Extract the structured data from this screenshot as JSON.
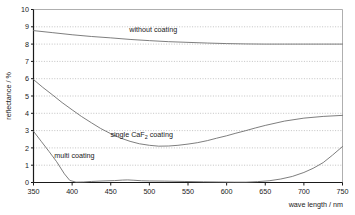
{
  "chart_data": {
    "type": "line",
    "title": "",
    "xlabel": "wave length / nm",
    "ylabel": "reflectance / %",
    "xlim": [
      350,
      750
    ],
    "ylim": [
      0,
      10
    ],
    "xticks": [
      350,
      400,
      450,
      500,
      550,
      600,
      650,
      700,
      750
    ],
    "yticks": [
      0,
      1,
      2,
      3,
      4,
      5,
      6,
      7,
      8,
      9,
      10
    ],
    "grid": "horizontal-dotted",
    "legend": "inline-annotations",
    "series": [
      {
        "name": "without coating",
        "label": "without coating",
        "label_x": 505,
        "label_y": 8.72,
        "x": [
          350,
          375,
          400,
          425,
          450,
          475,
          500,
          525,
          550,
          575,
          600,
          625,
          650,
          675,
          700,
          725,
          750
        ],
        "values": [
          8.78,
          8.66,
          8.54,
          8.44,
          8.36,
          8.27,
          8.2,
          8.14,
          8.1,
          8.06,
          8.03,
          8.01,
          8.0,
          8.0,
          8.0,
          8.0,
          8.0
        ]
      },
      {
        "name": "single CaF2 coating",
        "label_prefix": "single CaF",
        "label_sub": "2",
        "label_suffix": " coating",
        "label_x": 490,
        "label_y": 2.63,
        "x": [
          350,
          362,
          375,
          387,
          400,
          412,
          425,
          437,
          450,
          462,
          475,
          487,
          500,
          512,
          525,
          537,
          550,
          562,
          575,
          587,
          600,
          612,
          625,
          637,
          650,
          675,
          700,
          725,
          750
        ],
        "values": [
          5.95,
          5.5,
          5.05,
          4.62,
          4.2,
          3.82,
          3.45,
          3.12,
          2.82,
          2.58,
          2.38,
          2.24,
          2.15,
          2.1,
          2.11,
          2.15,
          2.22,
          2.3,
          2.42,
          2.56,
          2.7,
          2.85,
          3.0,
          3.15,
          3.3,
          3.55,
          3.72,
          3.82,
          3.88
        ]
      },
      {
        "name": "multi coating",
        "label": "multi coating",
        "label_x": 403,
        "label_y": 1.44,
        "x": [
          350,
          360,
          370,
          380,
          390,
          397,
          405,
          415,
          425,
          440,
          455,
          465,
          472,
          480,
          490,
          500,
          520,
          545,
          570,
          590,
          610,
          625,
          640,
          655,
          670,
          685,
          700,
          712,
          725,
          737,
          750
        ],
        "values": [
          2.96,
          2.38,
          1.8,
          1.2,
          0.5,
          0.12,
          0.02,
          0.03,
          0.06,
          0.09,
          0.11,
          0.14,
          0.15,
          0.13,
          0.1,
          0.09,
          0.08,
          0.06,
          0.04,
          0.03,
          0.02,
          0.02,
          0.05,
          0.1,
          0.2,
          0.35,
          0.58,
          0.82,
          1.15,
          1.58,
          2.08
        ]
      }
    ]
  },
  "colors": {
    "axis": "#1a1a1a",
    "grid": "#9a9a9a",
    "line": "#6f6f6f",
    "background": "#ffffff"
  }
}
